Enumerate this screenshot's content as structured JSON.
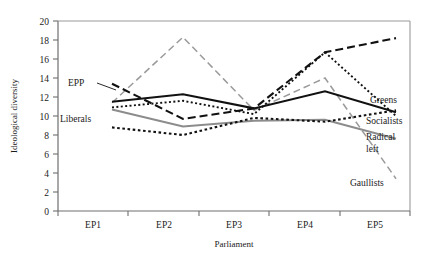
{
  "chart_data": {
    "type": "line",
    "title": "",
    "xlabel": "Parliament",
    "ylabel": "Ideological diversity",
    "categories": [
      "EP1",
      "EP2",
      "EP3",
      "EP4",
      "EP5"
    ],
    "ylim": [
      0,
      20
    ],
    "yticks": [
      0,
      2,
      4,
      6,
      8,
      10,
      12,
      14,
      16,
      18,
      20
    ],
    "grid": false,
    "legend": "inline-right",
    "series": [
      {
        "name": "EPP",
        "values": [
          13.4,
          9.7,
          10.8,
          16.7,
          18.2
        ],
        "style": "dashed",
        "color": "#111111",
        "label_position": "left"
      },
      {
        "name": "Greens",
        "values": [
          11.5,
          12.3,
          10.8,
          12.6,
          10.4
        ],
        "style": "solid",
        "color": "#111111",
        "label_position": "right"
      },
      {
        "name": "Socialists",
        "values": [
          8.8,
          8.0,
          9.8,
          9.4,
          10.6
        ],
        "style": "dotted",
        "color": "#111111",
        "label_position": "right"
      },
      {
        "name": "Liberals",
        "values": [
          10.9,
          11.6,
          10.2,
          16.7,
          10.0
        ],
        "style": "dotted",
        "color": "#111111",
        "label_position": "left"
      },
      {
        "name": "Radical left",
        "values": [
          10.7,
          8.9,
          9.5,
          9.6,
          7.6
        ],
        "style": "solid",
        "color": "#8c8c8c",
        "label_position": "right"
      },
      {
        "name": "Gaullists",
        "values": [
          11.4,
          18.3,
          10.6,
          14.0,
          3.4
        ],
        "style": "dashed",
        "color": "#9a9a9a",
        "label_position": "right"
      }
    ],
    "labels": {
      "epp": "EPP",
      "liberals": "Liberals",
      "greens": "Greens",
      "socialists": "Socialists",
      "radical_left_line1": "Radical",
      "radical_left_line2": "left",
      "gaullists": "Gaullists"
    },
    "ticklabels": {
      "t0": "0",
      "t2": "2",
      "t4": "4",
      "t6": "6",
      "t8": "8",
      "t10": "10",
      "t12": "12",
      "t14": "14",
      "t16": "16",
      "t18": "18",
      "t20": "20"
    },
    "catlabels": {
      "c0": "EP1",
      "c1": "EP2",
      "c2": "EP3",
      "c3": "EP4",
      "c4": "EP5"
    },
    "colors": {
      "axis": "#6e6e6e",
      "dark_series": "#111111",
      "gray_series": "#8c8c8c",
      "gaullist_gray": "#9a9a9a",
      "background": "#ffffff"
    }
  }
}
